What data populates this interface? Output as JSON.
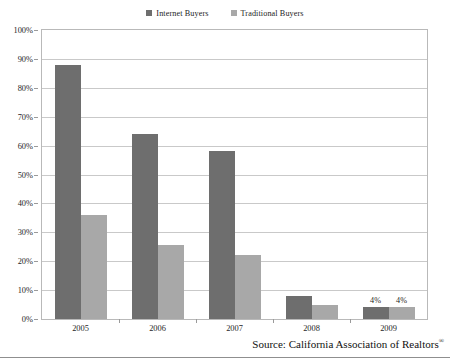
{
  "legend": {
    "position": "top-center",
    "entries": [
      {
        "label": "Internet Buyers",
        "color": "#6e6e6e",
        "marker": "square-marker"
      },
      {
        "label": "Traditional Buyers",
        "color": "#a8a8a8",
        "marker": "square-marker"
      }
    ]
  },
  "source": {
    "text": "Source: California Association of Realtors",
    "registered_mark": "®"
  },
  "chart_data": {
    "type": "bar",
    "title": "",
    "subtitle": "",
    "xlabel": "",
    "ylabel": "",
    "categories": [
      "2005",
      "2006",
      "2007",
      "2008",
      "2009"
    ],
    "series": [
      {
        "name": "Internet Buyers",
        "color": "#6e6e6e",
        "values": [
          88,
          64,
          58,
          8,
          4
        ],
        "labels": [
          "",
          "",
          "",
          "",
          "4%"
        ]
      },
      {
        "name": "Traditional Buyers",
        "color": "#a8a8a8",
        "values": [
          36,
          25.5,
          22,
          5,
          4
        ],
        "labels": [
          "",
          "",
          "",
          "",
          "4%"
        ]
      }
    ],
    "ylim": [
      0,
      100
    ],
    "ytick_step": 10,
    "ytick_labels": [
      "0%",
      "10%",
      "20%",
      "30%",
      "40%",
      "50%",
      "60%",
      "70%",
      "80%",
      "90%",
      "100%"
    ],
    "grid": true,
    "grid_axis": "y",
    "legend_position": "top-center"
  }
}
